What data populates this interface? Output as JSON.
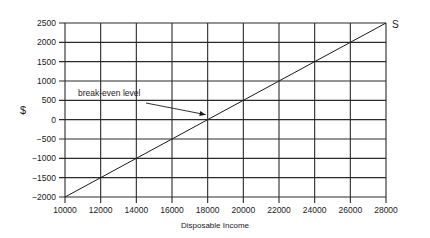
{
  "chart_data": {
    "type": "line",
    "title": "",
    "xlabel": "Disposable Income",
    "ylabel": "$",
    "xlim": [
      10000,
      28000
    ],
    "ylim": [
      -2000,
      2500
    ],
    "x_ticks": [
      10000,
      12000,
      14000,
      16000,
      18000,
      20000,
      22000,
      24000,
      26000,
      28000
    ],
    "y_ticks": [
      2500,
      2000,
      1500,
      1000,
      500,
      0,
      -500,
      -1000,
      -1500,
      -2000
    ],
    "grid": true,
    "legend": null,
    "series": [
      {
        "name": "S",
        "x": [
          10000,
          12000,
          14000,
          16000,
          18000,
          20000,
          22000,
          24000,
          26000,
          28000
        ],
        "values": [
          -2000,
          -1500,
          -1000,
          -500,
          0,
          500,
          1000,
          1500,
          2000,
          2500
        ]
      }
    ],
    "annotations": [
      {
        "text": "break-even level",
        "arrow_to": {
          "x": 18000,
          "y": 0
        }
      }
    ]
  },
  "labels": {
    "xlabel": "Disposable Income",
    "ylabel": "$",
    "series_label": "S",
    "annotation": "break-even level"
  },
  "colors": {
    "line": "#1a1a1a",
    "grid": "#2a2a2a",
    "text": "#1a1a1a"
  }
}
